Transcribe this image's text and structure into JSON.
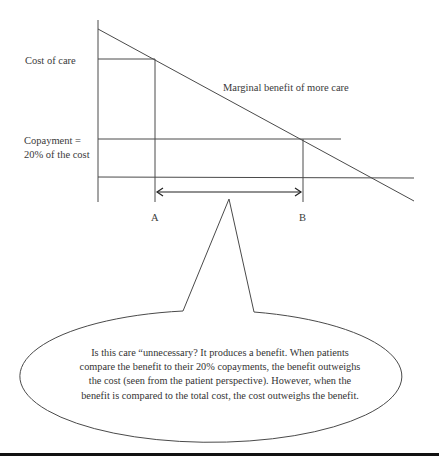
{
  "diagram": {
    "type": "economics-supply-demand-diagram",
    "labels": {
      "cost_of_care": "Cost of care",
      "copayment_line1": "Copayment =",
      "copayment_line2": "20% of the cost",
      "curve": "Marginal benefit of more care",
      "point_a": "A",
      "point_b": "B"
    },
    "callout": {
      "text": "Is this care “unnecessary? It produces a benefit. When patients compare the benefit to their 20% copayments, the benefit outweighs the cost (seen from the patient perspective). However, when the benefit is compared to the total cost, the cost outweighs the benefit."
    },
    "colors": {
      "line": "#4a4a4a",
      "text": "#3a3a3a",
      "rule": "#111111"
    }
  }
}
